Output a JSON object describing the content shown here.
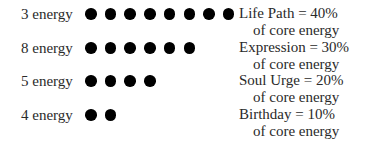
{
  "rows": [
    {
      "energy_label": "3 energy",
      "dots": 8,
      "line1": "Life Path  =  40%",
      "line2": "of core energy"
    },
    {
      "energy_label": "8 energy",
      "dots": 6,
      "line1": "Expression  =  30%",
      "line2": "of core energy"
    },
    {
      "energy_label": "5 energy",
      "dots": 4,
      "line1": "Soul Urge  =  20%",
      "line2": "of core energy"
    },
    {
      "energy_label": "4 energy",
      "dots": 2,
      "line1": "Birthday  =  10%",
      "line2": "of core energy"
    }
  ],
  "dot_color": "#000000"
}
